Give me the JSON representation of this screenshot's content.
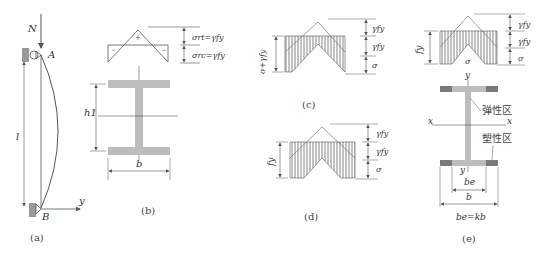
{
  "panels": {
    "a": {
      "caption": "(a)",
      "load_label": "N",
      "top_support_label": "A",
      "bottom_support_label": "B",
      "length_label": "l",
      "axis_label": "y"
    },
    "b": {
      "caption": "(b)",
      "tension_sign": "+",
      "compression_sign_left": "−",
      "compression_sign_right": "−",
      "residual_tension_label": "σrt=γfy",
      "residual_compression_label": "σrc=γfy",
      "height_label": "h1",
      "width_label": "b"
    },
    "c": {
      "caption": "(c)",
      "left_dim_label": "σ+γfy",
      "right_labels": [
        "γfy",
        "γfy",
        "σ"
      ]
    },
    "d": {
      "caption": "(d)",
      "left_dim_label": "fy",
      "right_labels": [
        "γfy",
        "γfy",
        "σ"
      ]
    },
    "e": {
      "caption": "(e)",
      "left_dim_label": "fy",
      "center_label": "σ",
      "right_labels": [
        "γfy",
        "γfy",
        "σ"
      ],
      "y_axis_top": "y",
      "y_axis_bottom": "y",
      "x_axis_left": "x",
      "x_axis_right": "x",
      "elastic_zone_label": "弹性区",
      "plastic_zone_label": "塑性区",
      "elastic_width_label": "be",
      "width_label": "b",
      "formula": "be=kb"
    }
  },
  "colors": {
    "section_fill": "#bdbdbd",
    "plastic_fill": "#7a7a7a",
    "line": "#555555",
    "hatch": "#666666"
  }
}
